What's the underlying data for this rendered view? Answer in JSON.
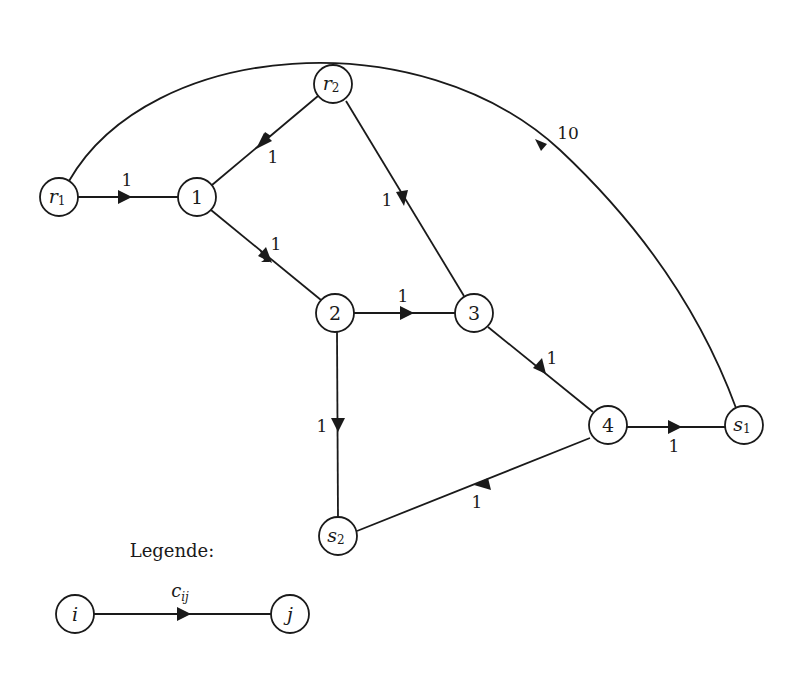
{
  "diagram": {
    "type": "directed-weighted-graph",
    "nodes": [
      {
        "id": "r1",
        "base": "r",
        "sub": "1",
        "x": 59,
        "y": 197
      },
      {
        "id": "n1",
        "base": "1",
        "sub": "",
        "x": 197,
        "y": 197
      },
      {
        "id": "r2",
        "base": "r",
        "sub": "2",
        "x": 333,
        "y": 84
      },
      {
        "id": "n2",
        "base": "2",
        "sub": "",
        "x": 335,
        "y": 313
      },
      {
        "id": "n3",
        "base": "3",
        "sub": "",
        "x": 474,
        "y": 313
      },
      {
        "id": "n4",
        "base": "4",
        "sub": "",
        "x": 608,
        "y": 425
      },
      {
        "id": "s1",
        "base": "s",
        "sub": "1",
        "x": 744,
        "y": 425
      },
      {
        "id": "s2",
        "base": "s",
        "sub": "2",
        "x": 338,
        "y": 536
      }
    ],
    "edges": [
      {
        "from": "r1",
        "to": "n1",
        "weight": "1"
      },
      {
        "from": "r2",
        "to": "n1",
        "weight": "1"
      },
      {
        "from": "r2",
        "to": "n3",
        "weight": "1"
      },
      {
        "from": "n1",
        "to": "n2",
        "weight": "1"
      },
      {
        "from": "n2",
        "to": "n3",
        "weight": "1"
      },
      {
        "from": "n2",
        "to": "s2",
        "weight": "1"
      },
      {
        "from": "n3",
        "to": "n4",
        "weight": "1"
      },
      {
        "from": "n4",
        "to": "s1",
        "weight": "1"
      },
      {
        "from": "n4",
        "to": "s2",
        "weight": "1"
      },
      {
        "from": "r1",
        "to": "s1",
        "weight": "10",
        "curved": true
      }
    ],
    "weights": {
      "r1_n1": "1",
      "r2_n1": "1",
      "r2_n3": "1",
      "n1_n2": "1",
      "n2_n3": "1",
      "n2_s2": "1",
      "n3_n4": "1",
      "n4_s1": "1",
      "n4_s2": "1",
      "r1_s1": "10"
    },
    "labels": {
      "r1": {
        "base": "r",
        "sub": "1"
      },
      "n1": {
        "base": "1"
      },
      "r2": {
        "base": "r",
        "sub": "2"
      },
      "n2": {
        "base": "2"
      },
      "n3": {
        "base": "3"
      },
      "n4": {
        "base": "4"
      },
      "s1": {
        "base": "s",
        "sub": "1"
      },
      "s2": {
        "base": "s",
        "sub": "2"
      }
    }
  },
  "legend": {
    "title": "Legende:",
    "from_node": "i",
    "to_node": "j",
    "edge_label_base": "c",
    "edge_label_sub": "ij"
  },
  "colors": {
    "stroke": "#1a1a1a",
    "background": "#ffffff"
  }
}
